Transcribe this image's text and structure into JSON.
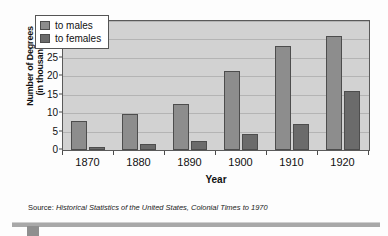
{
  "chart_data": {
    "type": "bar",
    "title": "",
    "xlabel": "Year",
    "ylabel": "Number of Degrees (in thousands)",
    "ylabel_line1": "Number of Degrees",
    "ylabel_line2": "(in thousands)",
    "categories": [
      "1870",
      "1880",
      "1890",
      "1900",
      "1910",
      "1920"
    ],
    "series": [
      {
        "name": "to males",
        "color": "#8d8d8d",
        "values": [
          7.8,
          9.9,
          12.5,
          21.5,
          28.2,
          31.0
        ]
      },
      {
        "name": "to females",
        "color": "#6b6b6b",
        "values": [
          0.8,
          1.6,
          2.4,
          4.3,
          7.1,
          16.0
        ]
      }
    ],
    "ylim": [
      0,
      35
    ],
    "yticks": [
      0,
      5,
      10,
      15,
      20,
      25,
      30,
      35
    ],
    "ytick_labels": [
      "0",
      "5",
      "10",
      "15",
      "20",
      "25",
      "30",
      "35"
    ],
    "grid": true,
    "legend_position": "upper-left",
    "plot_background": "#d2d2d2"
  },
  "legend": {
    "items": [
      {
        "label": "to males",
        "color": "#8d8d8d"
      },
      {
        "label": "to females",
        "color": "#6b6b6b"
      }
    ]
  },
  "source": {
    "label": "Source:",
    "title": "Historical Statistics of the United States, Colonial Times to 1970"
  }
}
